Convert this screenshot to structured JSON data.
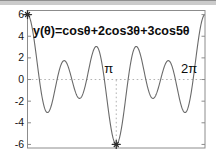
{
  "figure": {
    "background": "#ffffff",
    "top_band": {
      "edge_color": "#8f8f8f",
      "fill_color": "#cbcbcb"
    }
  },
  "chart_data": {
    "type": "line",
    "title": "y(θ)=cosθ+2cos3θ+3cos5θ",
    "xlabel": "",
    "ylabel": "",
    "x_unit": "radians",
    "xlim": [
      0,
      6.2832
    ],
    "ylim": [
      -6.33,
      6.38
    ],
    "grid": false,
    "box": true,
    "legend": "none",
    "axis_color": "#8c8c8c",
    "tick_label_color": "#141414",
    "curve_color": "#6a6a6a",
    "marker_color": "#2f2f2f",
    "dotted_color": "#b3b3b3",
    "expression": "y(θ) = cos(θ) + 2cos(3θ) + 3cos(5θ)",
    "series": [
      {
        "name": "y(θ)=cosθ+2cos3θ+3cos5θ",
        "color": "#6a6a6a",
        "harmonics": [
          {
            "amplitude": 1,
            "frequency": 1
          },
          {
            "amplitude": 2,
            "frequency": 3
          },
          {
            "amplitude": 3,
            "frequency": 5
          }
        ]
      }
    ],
    "key_points": [
      {
        "x": 0,
        "y": 6,
        "note": "global max, asterisk marker"
      },
      {
        "x": 0.7,
        "y": -3.05,
        "note": "local min"
      },
      {
        "x": 1.31,
        "y": 1.75,
        "note": "local max"
      },
      {
        "x": 1.85,
        "y": -1.7,
        "note": "local min"
      },
      {
        "x": 2.42,
        "y": 3.01,
        "note": "local max"
      },
      {
        "x": 3.1416,
        "y": -6,
        "note": "global min, asterisk marker"
      },
      {
        "x": 3.86,
        "y": 3.01,
        "note": "local max"
      },
      {
        "x": 4.43,
        "y": -1.7,
        "note": "local min"
      },
      {
        "x": 4.97,
        "y": 1.75,
        "note": "local max"
      },
      {
        "x": 5.58,
        "y": -3.05,
        "note": "local min"
      },
      {
        "x": 6.2832,
        "y": 6,
        "note": "global max"
      }
    ],
    "markers": [
      {
        "x": 0,
        "y": 6,
        "shape": "asterisk"
      },
      {
        "x": 3.1416,
        "y": -6,
        "shape": "asterisk"
      }
    ],
    "reference_lines": [
      {
        "type": "horizontal",
        "y": 0,
        "style": "dotted",
        "x_from": 0,
        "x_to": 6.2832
      },
      {
        "type": "vertical",
        "x": 3.1416,
        "style": "dotted",
        "y_from": -6,
        "y_to": 0
      }
    ],
    "annotations": [
      {
        "text": "π",
        "x": 2.88,
        "y": 0.95
      },
      {
        "text": "2π",
        "x": 5.72,
        "y": 0.95
      }
    ],
    "y_ticks": [
      -6,
      -4,
      -2,
      0,
      2,
      4,
      6
    ],
    "y_tick_labels": [
      "-6",
      "-4",
      "-2",
      "0",
      "2",
      "4",
      "6"
    ],
    "x_ticks": []
  }
}
